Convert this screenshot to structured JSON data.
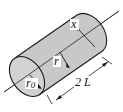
{
  "diagram": {
    "labels": {
      "x": "x",
      "r": "r",
      "r0_main": "r",
      "r0_sub": "0",
      "length": "2 L"
    },
    "colors": {
      "fill": "#c8c8c8",
      "stroke": "#1a1a1a",
      "background": "#ffffff"
    }
  }
}
